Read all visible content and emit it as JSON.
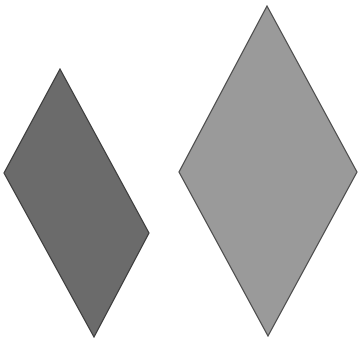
{
  "diagram": {
    "background": "#ffffff",
    "shapes": [
      {
        "id": "left-rhombus",
        "type": "rhombus",
        "fill": "#6b6b6b",
        "stroke": "#3a3a3a",
        "points": "60,69 149,233 94,337 4,173"
      },
      {
        "id": "right-rhombus",
        "type": "rhombus",
        "fill": "#9a9a9a",
        "stroke": "#4a4a4a",
        "points": "267,6 357,172 268,336 179,172"
      }
    ]
  }
}
